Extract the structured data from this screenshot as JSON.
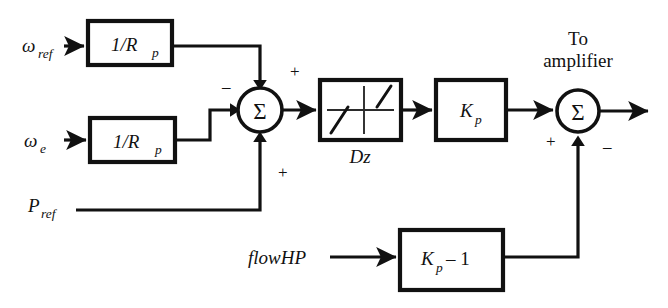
{
  "diagram": {
    "background_color": "#ffffff",
    "line_color": "#111111"
  },
  "inputs": {
    "omega_ref": {
      "symbol": "ω",
      "subscript": "ref"
    },
    "omega_e": {
      "symbol": "ω",
      "subscript": "e"
    },
    "p_ref": {
      "symbol": "P",
      "subscript": "ref"
    },
    "flow_hp": {
      "label": "flowHP"
    }
  },
  "blocks": {
    "gain_droop_ref": {
      "name": "1/R",
      "subscript": "p"
    },
    "gain_droop_e": {
      "name": "1/R",
      "subscript": "p"
    },
    "deadzone": {
      "caption": "Dz"
    },
    "gain_kp": {
      "name": "K",
      "subscript": "p"
    },
    "gain_kp_minus_one": {
      "name": "K",
      "subscript": "p",
      "suffix": "– 1"
    }
  },
  "summing_junctions": {
    "first": {
      "symbol": "Σ",
      "sign_top": "+",
      "sign_left": "–",
      "sign_bottom": "+"
    },
    "second": {
      "symbol": "Σ",
      "sign_left": "+",
      "sign_bottom": "–"
    }
  },
  "outputs": {
    "to_amplifier": {
      "line1": "To",
      "line2": "amplifier"
    }
  }
}
